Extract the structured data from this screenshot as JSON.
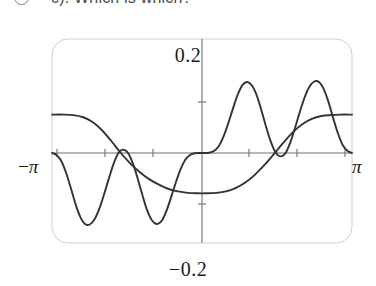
{
  "header": {
    "bullet_icon": "circle-bullet-icon",
    "text": "c). Which is which?"
  },
  "figure": {
    "name": "function-plot",
    "frame": {
      "x": 52,
      "y": 39,
      "width": 300,
      "height": 204,
      "corner_radius": 16,
      "color": "#cfcfcf"
    },
    "axes": {
      "x_axis_y": 153,
      "y_axis_x": 202,
      "color": "#6f6f6f",
      "tick_positions_x": [
        57,
        105,
        153,
        249,
        297,
        345
      ],
      "tick_half_height": 4
    },
    "labels": {
      "top": "0.2",
      "bottom": "−0.2",
      "left_minus": "−",
      "left_pi": "π",
      "right_pi": "π"
    }
  },
  "chart_data": {
    "type": "line",
    "title": "",
    "subtitle": "",
    "xlabel": "",
    "ylabel": "",
    "xlim": [
      -3.14159265,
      3.14159265
    ],
    "ylim": [
      -0.2,
      0.2
    ],
    "xticks": [
      -3.14159265,
      3.14159265
    ],
    "xticklabels": [
      "−π",
      "π"
    ],
    "yticks": [
      -0.2,
      0.2
    ],
    "yticklabels": [
      "−0.2",
      "0.2"
    ],
    "grid": false,
    "legend": "none",
    "annotations": [
      "0.2",
      "−0.2",
      "−π",
      "π"
    ],
    "series": [
      {
        "name": "oscillating-curve",
        "color": "#333333",
        "description": "odd oscillating wave with three negative lobes on the left half and three positive lobes on the right half, flat near zero at the centre and at the outer edges",
        "x": [
          -3.142,
          -3.05,
          -2.95,
          -2.85,
          -2.75,
          -2.65,
          -2.55,
          -2.45,
          -2.35,
          -2.25,
          -2.15,
          -2.05,
          -1.95,
          -1.85,
          -1.75,
          -1.65,
          -1.55,
          -1.45,
          -1.35,
          -1.25,
          -1.15,
          -1.05,
          -0.95,
          -0.85,
          -0.75,
          -0.65,
          -0.55,
          -0.45,
          -0.35,
          -0.25,
          -0.15,
          -0.05,
          0.0,
          0.05,
          0.15,
          0.25,
          0.35,
          0.45,
          0.55,
          0.65,
          0.75,
          0.85,
          0.95,
          1.05,
          1.15,
          1.25,
          1.35,
          1.45,
          1.55,
          1.65,
          1.75,
          1.85,
          1.95,
          2.05,
          2.15,
          2.25,
          2.35,
          2.45,
          2.55,
          2.65,
          2.75,
          2.85,
          2.95,
          3.05,
          3.142
        ],
        "y": [
          0.0,
          -0.004,
          -0.016,
          -0.04,
          -0.072,
          -0.106,
          -0.133,
          -0.148,
          -0.149,
          -0.138,
          -0.116,
          -0.086,
          -0.053,
          -0.022,
          0.0,
          0.007,
          0.0,
          -0.021,
          -0.052,
          -0.087,
          -0.119,
          -0.14,
          -0.148,
          -0.142,
          -0.122,
          -0.093,
          -0.062,
          -0.034,
          -0.014,
          -0.004,
          -0.0005,
          0.0,
          0.0,
          0.0,
          0.0005,
          0.004,
          0.014,
          0.034,
          0.062,
          0.093,
          0.122,
          0.142,
          0.148,
          0.14,
          0.119,
          0.087,
          0.052,
          0.021,
          0.0,
          -0.007,
          0.0,
          0.022,
          0.053,
          0.086,
          0.116,
          0.138,
          0.149,
          0.148,
          0.133,
          0.106,
          0.072,
          0.04,
          0.016,
          0.004,
          0.0
        ]
      },
      {
        "name": "sigmoid-curve",
        "color": "#333333",
        "description": "monotone tanh-like step: plateau at +0.2 on the far left, descending through the origin region to a plateau at −0.11 and then rising to +0.2 plateau on the far right",
        "x": [
          -3.142,
          -2.9,
          -2.7,
          -2.5,
          -2.3,
          -2.1,
          -1.9,
          -1.7,
          -1.5,
          -1.3,
          -1.1,
          -0.9,
          -0.7,
          -0.5,
          -0.3,
          -0.1,
          0.1,
          0.3,
          0.5,
          0.7,
          0.9,
          1.1,
          1.3,
          1.5,
          1.7,
          1.9,
          2.1,
          2.3,
          2.5,
          2.7,
          2.9,
          3.142
        ],
        "y": [
          0.08,
          0.08,
          0.079,
          0.075,
          0.065,
          0.048,
          0.025,
          0.0,
          -0.022,
          -0.04,
          -0.055,
          -0.066,
          -0.075,
          -0.08,
          -0.083,
          -0.084,
          -0.084,
          -0.083,
          -0.08,
          -0.073,
          -0.062,
          -0.046,
          -0.026,
          -0.003,
          0.021,
          0.043,
          0.06,
          0.071,
          0.077,
          0.079,
          0.08,
          0.08
        ]
      }
    ]
  }
}
